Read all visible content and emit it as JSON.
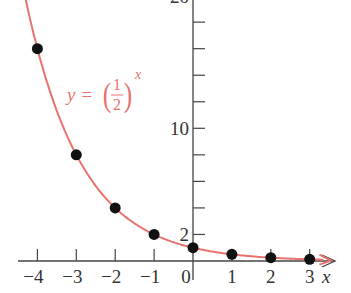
{
  "chart_data": {
    "type": "line",
    "title": "",
    "function_label": {
      "lhs": "y =",
      "num": "1",
      "den": "2",
      "exp": "x"
    },
    "xlabel": "x",
    "ylabel": "",
    "xlim": [
      -4.5,
      3.6
    ],
    "ylim": [
      -1.5,
      20
    ],
    "x_ticks": [
      -4,
      -3,
      -2,
      -1,
      0,
      1,
      2,
      3
    ],
    "x_tick_labels": [
      "−4",
      "−3",
      "−2",
      "−1",
      "0",
      "1",
      "2",
      "3"
    ],
    "y_ticks": [
      2,
      4,
      6,
      8,
      10,
      12,
      14,
      16,
      18,
      20
    ],
    "y_tick_labels": {
      "2": "2",
      "10": "10",
      "20": "20"
    },
    "grid": false,
    "series": [
      {
        "name": "y = (1/2)^x",
        "kind": "curve",
        "color": "#e8736e",
        "x": [
          -4,
          -3,
          -2,
          -1,
          0,
          1,
          2,
          3
        ],
        "values": [
          16,
          8,
          4,
          2,
          1,
          0.5,
          0.25,
          0.125
        ]
      }
    ],
    "points": {
      "color": "#111111",
      "x": [
        -4,
        -3,
        -2,
        -1,
        0,
        1,
        2,
        3
      ],
      "y": [
        16,
        8,
        4,
        2,
        1,
        0.5,
        0.25,
        0.125
      ]
    }
  },
  "colors": {
    "curve": "#e8736e",
    "axis": "#444444",
    "point": "#111111"
  }
}
